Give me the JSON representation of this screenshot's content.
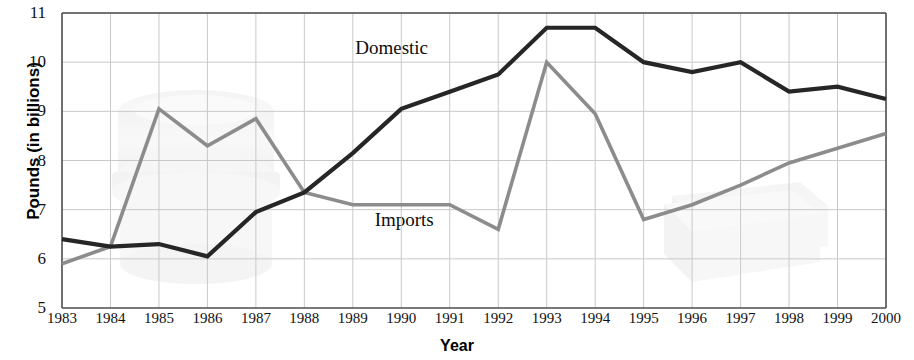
{
  "chart_data": {
    "type": "line",
    "title": "",
    "xlabel": "Year",
    "ylabel": "Pounds (in billions)",
    "xlim": [
      1983,
      2000
    ],
    "ylim": [
      5,
      11
    ],
    "grid": true,
    "legend_position": "inline-labels",
    "x": [
      1983,
      1984,
      1985,
      1986,
      1987,
      1988,
      1989,
      1990,
      1991,
      1992,
      1993,
      1994,
      1995,
      1996,
      1997,
      1998,
      1999,
      2000
    ],
    "xtick_labels": [
      "1983",
      "1984",
      "1985",
      "1986",
      "1987",
      "1988",
      "1989",
      "1990",
      "1991",
      "1992",
      "1993",
      "1994",
      "1995",
      "1996",
      "1997",
      "1998",
      "1999",
      "2000"
    ],
    "ytick_labels": [
      "5",
      "6",
      "7",
      "8",
      "9",
      "10",
      "11"
    ],
    "ytick_values": [
      5,
      6,
      7,
      8,
      9,
      10,
      11
    ],
    "series": [
      {
        "name": "Domestic",
        "color": "#262626",
        "label_x": 1989.05,
        "label_y": 10.28,
        "values": [
          6.4,
          6.25,
          6.3,
          6.05,
          6.95,
          7.35,
          8.15,
          9.05,
          9.4,
          9.75,
          10.7,
          10.7,
          10.0,
          9.8,
          10.0,
          9.4,
          9.5,
          9.25
        ]
      },
      {
        "name": "Imports",
        "color": "#8c8c8c",
        "label_x": 1989.45,
        "label_y": 6.78,
        "values": [
          5.9,
          6.25,
          9.05,
          8.3,
          8.85,
          7.35,
          7.1,
          7.1,
          7.1,
          6.6,
          10.0,
          8.95,
          6.8,
          7.1,
          7.5,
          7.95,
          8.25,
          8.55
        ]
      }
    ],
    "axis_color": "#4d4d4d",
    "grid_color": "#c9c9c9",
    "background": "#ffffff"
  },
  "watermarks": [
    {
      "name": "tub-watermark",
      "shape": "cylindrical-tub"
    },
    {
      "name": "carton-watermark",
      "shape": "flat-carton-box"
    }
  ]
}
